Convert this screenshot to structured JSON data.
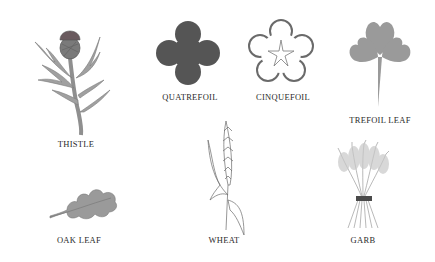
{
  "plate": {
    "items": [
      {
        "id": "thistle",
        "label": "THISTLE"
      },
      {
        "id": "quatrefoil",
        "label": "QUATREFOIL"
      },
      {
        "id": "cinquefoil",
        "label": "CINQUEFOIL"
      },
      {
        "id": "trefoil_leaf",
        "label": "TREFOIL LEAF"
      },
      {
        "id": "oak_leaf",
        "label": "OAK LEAF"
      },
      {
        "id": "wheat",
        "label": "WHEAT"
      },
      {
        "id": "garb",
        "label": "GARB"
      }
    ],
    "colors": {
      "background": "#ffffff",
      "quatrefoil_fill": "#555555",
      "foliage_fill": "#9a9a9a",
      "outline": "#5a5a5a",
      "label_text": "#2a2a2a"
    }
  }
}
